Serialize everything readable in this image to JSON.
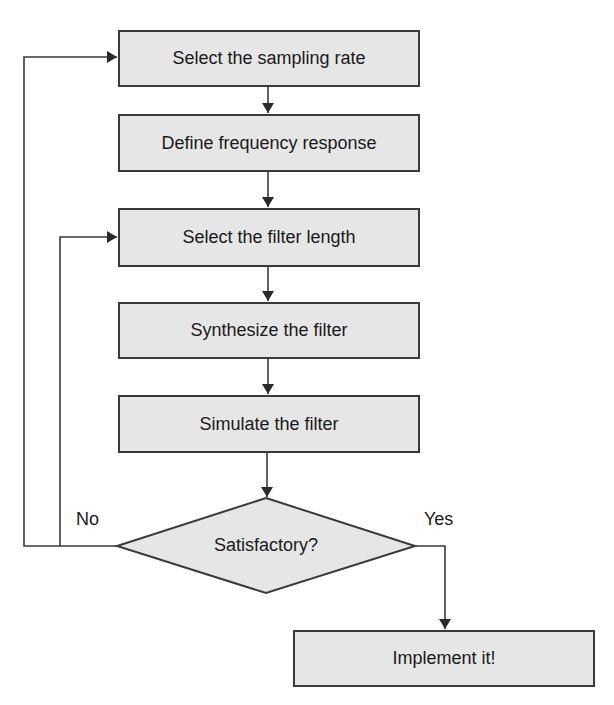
{
  "diagram": {
    "type": "flowchart",
    "colors": {
      "box_fill": "#e6e6e6",
      "stroke": "#3a3a3a",
      "text": "#1a1a1a"
    },
    "nodes": [
      {
        "id": "n1",
        "shape": "rect",
        "label": "Select the sampling rate"
      },
      {
        "id": "n2",
        "shape": "rect",
        "label": "Define frequency response"
      },
      {
        "id": "n3",
        "shape": "rect",
        "label": "Select the filter length"
      },
      {
        "id": "n4",
        "shape": "rect",
        "label": "Synthesize the filter"
      },
      {
        "id": "n5",
        "shape": "rect",
        "label": "Simulate the filter"
      },
      {
        "id": "d1",
        "shape": "diamond",
        "label": "Satisfactory?"
      },
      {
        "id": "n6",
        "shape": "rect",
        "label": "Implement it!"
      }
    ],
    "edges": [
      {
        "from": "n1",
        "to": "n2"
      },
      {
        "from": "n2",
        "to": "n3"
      },
      {
        "from": "n3",
        "to": "n4"
      },
      {
        "from": "n4",
        "to": "n5"
      },
      {
        "from": "n5",
        "to": "d1"
      },
      {
        "from": "d1",
        "to": "n6",
        "label": "Yes"
      },
      {
        "from": "d1",
        "to": "n1",
        "label": "No"
      },
      {
        "from": "d1",
        "to": "n3",
        "label": "No"
      }
    ],
    "edge_labels": {
      "no": "No",
      "yes": "Yes"
    }
  }
}
